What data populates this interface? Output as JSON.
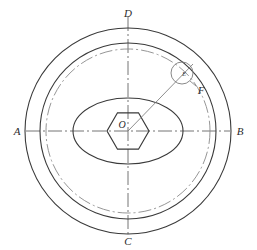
{
  "drawing": {
    "title": "Circular flange front view with hexagonal bore",
    "background_color": "#ffffff",
    "line_color": "#3a3a3a",
    "centerline_color": "#6f6f6f",
    "width": 257,
    "height": 250,
    "center": {
      "x": 128,
      "y": 131
    },
    "labels": {
      "axis_left": "A",
      "axis_right": "B",
      "axis_bottom": "C",
      "axis_top": "D",
      "center_point": "O",
      "detail_circle": "E",
      "detail_leader": "F"
    },
    "geometry": {
      "outer_circle_radius": 103,
      "second_circle_radius": 88,
      "pitch_circle_radius": 82,
      "inner_ellipse_rx": 55,
      "inner_ellipse_ry": 33,
      "hexagon_radius": 21,
      "detail_circle_radius": 11,
      "detail_circle_center": {
        "x": 182,
        "y": 73
      }
    },
    "line_styles": {
      "visible_edge": "solid",
      "center_axis": "dash-dot",
      "pitch_circle": "dash-dot",
      "leader": "thin-solid"
    }
  }
}
